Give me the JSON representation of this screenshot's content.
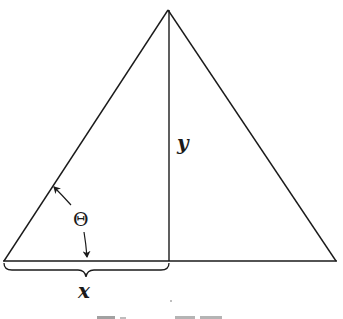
{
  "diagram": {
    "type": "geometry",
    "shape": "isosceles-triangle",
    "labels": {
      "height": "y",
      "half_base": "x",
      "angle": "Θ"
    },
    "colors": {
      "line": "#1a1a1a",
      "background": "#ffffff"
    },
    "caption_fragment": "FIGURE"
  }
}
